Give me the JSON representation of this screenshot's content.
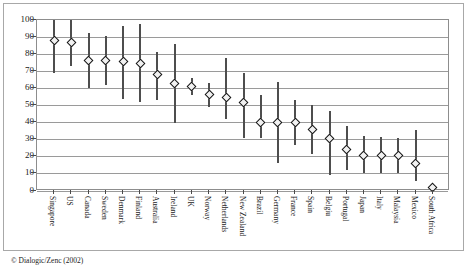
{
  "figure": {
    "credit": "© Dialogic/Zenc (2002)",
    "frame_color": "#a8a8a8",
    "axis_color": "#8d8d8d",
    "grid_color": "#9a9a9a",
    "whisker_color": "#4e4e4e",
    "marker_fill": "#f2f2f2",
    "marker_edge": "#151515"
  },
  "chart_data": {
    "type": "scatter",
    "title": "",
    "subtitle": "",
    "xlabel": "",
    "ylabel": "",
    "ylim": [
      0,
      100
    ],
    "yticks": [
      0,
      10,
      20,
      30,
      40,
      50,
      60,
      70,
      80,
      90,
      100
    ],
    "ytick_labels": [
      "0",
      "10",
      "20",
      "30",
      "40",
      "50",
      "60",
      "70",
      "80",
      "90",
      "100"
    ],
    "grid": true,
    "grid_axis": "y",
    "legend": "none",
    "marker_style": "open-diamond",
    "error_bar_style": "vertical-range-line",
    "categories": [
      "Singapore",
      "US",
      "Canada",
      "Sweden",
      "Denmark",
      "Finland",
      "Australia",
      "Ireland",
      "UK",
      "Norway",
      "Netherlands",
      "New Zealand",
      "Brazil",
      "Germany",
      "France",
      "Spain",
      "Belgiu",
      "Portugal",
      "Japan",
      "Italy",
      "Malaysia",
      "Mexico",
      "South Africa"
    ],
    "series": [
      {
        "name": "Score",
        "values": [
          88,
          87,
          76.5,
          76.5,
          75.5,
          74.5,
          68,
          63,
          61,
          56.5,
          54.5,
          52,
          40,
          40,
          40,
          36,
          30.5,
          24.5,
          21,
          21,
          20.5,
          16,
          2
        ],
        "lower": [
          69,
          73,
          60.5,
          62,
          54,
          52,
          53.5,
          40,
          56,
          49,
          42,
          31,
          31,
          16.5,
          27,
          21.5,
          9.5,
          12,
          10.5,
          10.5,
          10.5,
          6,
          2
        ],
        "upper": [
          101,
          101,
          92.5,
          90.5,
          96.5,
          97.5,
          81.5,
          86,
          66,
          63,
          77.5,
          69,
          56,
          63.5,
          53,
          50.5,
          46.5,
          38,
          32,
          31.5,
          31,
          35.5,
          2
        ]
      }
    ]
  }
}
